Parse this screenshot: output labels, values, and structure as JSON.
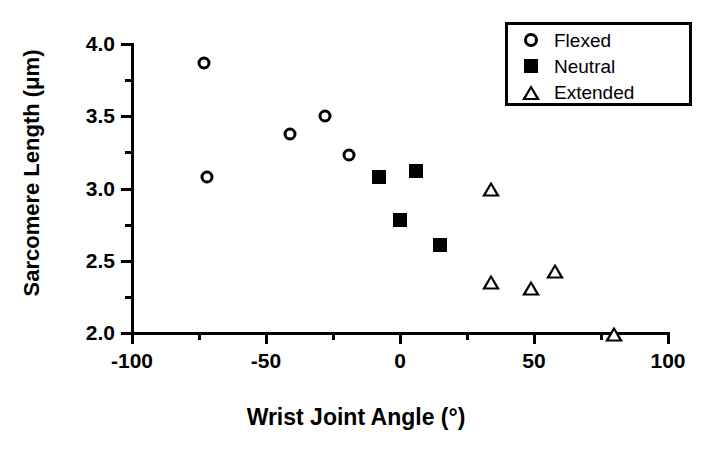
{
  "chart_data": {
    "type": "scatter",
    "title": "",
    "xlabel": "Wrist Joint Angle (°)",
    "ylabel": "Sarcomere Length (μm)",
    "xlim": [
      -100,
      100
    ],
    "ylim": [
      2.0,
      4.0
    ],
    "xticks": [
      -100,
      -50,
      0,
      50,
      100
    ],
    "xtick_labels": [
      "-100",
      "-50",
      "0",
      "50",
      "100"
    ],
    "xminor_ticks": [
      -75,
      -25,
      25,
      75
    ],
    "yticks": [
      2.0,
      2.5,
      3.0,
      3.5,
      4.0
    ],
    "ytick_labels": [
      "2.0",
      "2.5",
      "3.0",
      "3.5",
      "4.0"
    ],
    "yminor_ticks": [
      2.25,
      2.75,
      3.25,
      3.75
    ],
    "grid": false,
    "legend_position": "top-right",
    "series": [
      {
        "name": "Flexed",
        "marker": "open-circle",
        "color": "#000000",
        "points": [
          {
            "x": -73,
            "y": 3.87
          },
          {
            "x": -72,
            "y": 3.08
          },
          {
            "x": -41,
            "y": 3.38
          },
          {
            "x": -28,
            "y": 3.5
          },
          {
            "x": -19,
            "y": 3.23
          }
        ]
      },
      {
        "name": "Neutral",
        "marker": "filled-square",
        "color": "#000000",
        "points": [
          {
            "x": -8,
            "y": 3.08
          },
          {
            "x": 0,
            "y": 2.78
          },
          {
            "x": 6,
            "y": 3.12
          },
          {
            "x": 15,
            "y": 2.61
          }
        ]
      },
      {
        "name": "Extended",
        "marker": "open-triangle",
        "color": "#000000",
        "points": [
          {
            "x": 34,
            "y": 3.0
          },
          {
            "x": 34,
            "y": 2.46
          },
          {
            "x": 49,
            "y": 2.52
          },
          {
            "x": 58,
            "y": 2.74
          },
          {
            "x": 80,
            "y": 2.41
          }
        ]
      }
    ]
  },
  "legend": {
    "entries": [
      {
        "label": "Flexed",
        "marker": "open-circle"
      },
      {
        "label": "Neutral",
        "marker": "filled-square"
      },
      {
        "label": "Extended",
        "marker": "open-triangle"
      }
    ]
  }
}
